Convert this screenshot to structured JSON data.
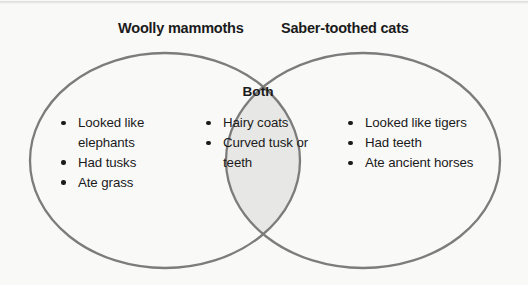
{
  "diagram": {
    "type": "venn",
    "title_left": "Woolly mammoths",
    "title_right": "Saber-toothed cats",
    "center_label": "Both",
    "colors": {
      "stroke": "#7c7c7c",
      "intersection_fill": "#e7e7e5",
      "circle_fill": "#f9f9f8",
      "background": "#f9f9f8",
      "text": "#1b1b1b"
    },
    "left_items": [
      "Looked like elephants",
      "Had tusks",
      "Ate grass"
    ],
    "both_items": [
      "Hairy coats",
      "Curved tusk or teeth"
    ],
    "right_items": [
      "Looked like tigers",
      "Had teeth",
      "Ate ancient horses"
    ]
  }
}
